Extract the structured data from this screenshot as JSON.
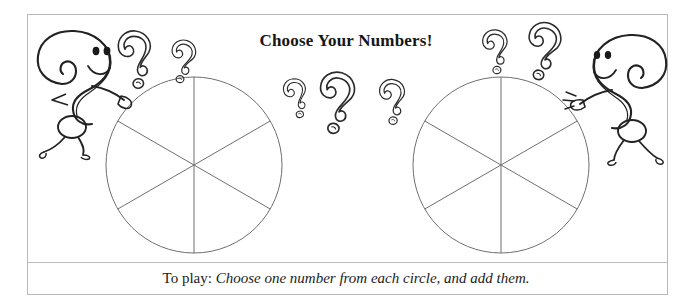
{
  "page": {
    "background_color": "#ffffff",
    "frame_color": "#b8b8b8",
    "ink_color": "#2b2b2b"
  },
  "title": {
    "text": "Choose Your Numbers!"
  },
  "caption": {
    "lead": "To play:",
    "body": "Choose one number from each circle, and add them."
  },
  "spinners": [
    {
      "name": "left-circle",
      "center_x": 194,
      "center_y": 165,
      "radius": 88,
      "sectors": 6,
      "divider_angles_deg": [
        90,
        30,
        150
      ]
    },
    {
      "name": "right-circle",
      "center_x": 501,
      "center_y": 165,
      "radius": 88,
      "sectors": 6,
      "divider_angles_deg": [
        90,
        30,
        150
      ]
    }
  ],
  "characters": [
    {
      "name": "question-mark-character-left",
      "facing": "right"
    },
    {
      "name": "question-mark-character-right",
      "facing": "left"
    }
  ],
  "floating_question_marks": [
    {
      "id": "qm-1",
      "x": 136,
      "y": 52,
      "scale": 1.05,
      "rotate": -8
    },
    {
      "id": "qm-2",
      "x": 184,
      "y": 56,
      "scale": 0.78,
      "rotate": 6
    },
    {
      "id": "qm-3",
      "x": 296,
      "y": 93,
      "scale": 0.72,
      "rotate": -14
    },
    {
      "id": "qm-4",
      "x": 338,
      "y": 95,
      "scale": 1.12,
      "rotate": 4
    },
    {
      "id": "qm-5",
      "x": 393,
      "y": 96,
      "scale": 0.82,
      "rotate": -4
    },
    {
      "id": "qm-6",
      "x": 496,
      "y": 46,
      "scale": 0.8,
      "rotate": -6
    },
    {
      "id": "qm-7",
      "x": 545,
      "y": 44,
      "scale": 1.05,
      "rotate": 8
    }
  ],
  "icons": {
    "separator": "horizontal-rule"
  }
}
